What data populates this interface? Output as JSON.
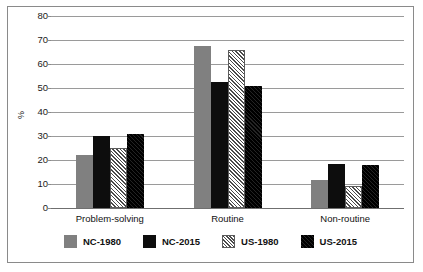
{
  "chart_data": {
    "type": "bar",
    "title": "",
    "xlabel": "",
    "ylabel": "%",
    "ylim": [
      0,
      80
    ],
    "yticks": [
      0,
      10,
      20,
      30,
      40,
      50,
      60,
      70,
      80
    ],
    "grid": true,
    "legend_position": "bottom",
    "categories": [
      "Problem-solving",
      "Routine",
      "Non-routine"
    ],
    "series": [
      {
        "name": "NC-1980",
        "color": "#808080",
        "pattern": "solid",
        "values": [
          22,
          67.5,
          11.5
        ]
      },
      {
        "name": "NC-2015",
        "color": "#0d0d0d",
        "pattern": "solid",
        "values": [
          30,
          52.5,
          18.5
        ]
      },
      {
        "name": "US-1980",
        "color": "#4a4a4a",
        "pattern": "hatch-light",
        "values": [
          25,
          66,
          9
        ]
      },
      {
        "name": "US-2015",
        "color": "#0d0d0d",
        "pattern": "hatch-dark",
        "values": [
          31,
          51,
          18
        ]
      }
    ]
  }
}
